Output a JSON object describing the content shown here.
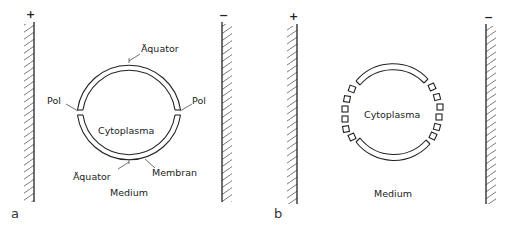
{
  "panels": [
    {
      "id": "a",
      "label": "a",
      "electrodes": {
        "left_sign": "+",
        "right_sign": "−"
      },
      "labels": {
        "equator_top": "Äquator",
        "equator_bottom": "Äquator",
        "pole_left": "Pol",
        "pole_right": "Pol",
        "center": "Cytoplasma",
        "membrane": "Membran",
        "medium": "Medium"
      }
    },
    {
      "id": "b",
      "label": "b",
      "electrodes": {
        "left_sign": "+",
        "right_sign": "−"
      },
      "labels": {
        "center": "Cytoplasma",
        "medium": "Medium"
      }
    }
  ],
  "colors": {
    "ink": "#222222",
    "background": "#ffffff"
  }
}
